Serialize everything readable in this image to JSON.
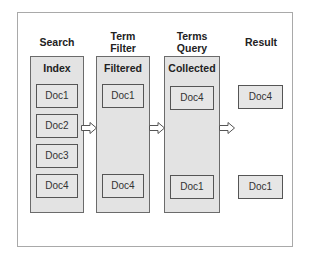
{
  "stages": [
    {
      "title": "Search",
      "label": "Index",
      "docs": [
        "Doc1",
        "Doc2",
        "Doc3",
        "Doc4"
      ]
    },
    {
      "title": "Term Filter",
      "title_line1": "Term",
      "title_line2": "Filter",
      "label": "Filtered",
      "docs": [
        "Doc1",
        "Doc4"
      ]
    },
    {
      "title": "Terms Query",
      "title_line1": "Terms",
      "title_line2": "Query",
      "label": "Collected",
      "docs": [
        "Doc4",
        "Doc1"
      ]
    },
    {
      "title": "Result",
      "docs": [
        "Doc4",
        "Doc1"
      ]
    }
  ],
  "colors": {
    "column_fill": "#e3e3e3",
    "doc_fill": "#e6e6e6",
    "border": "#555555",
    "frame_border": "#a9a9a9"
  }
}
